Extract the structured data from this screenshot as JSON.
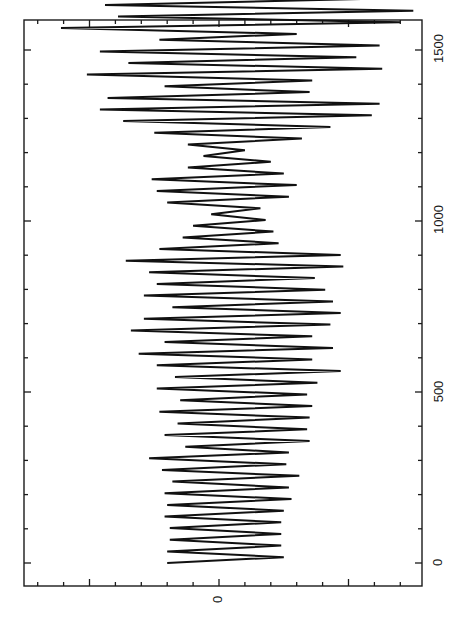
{
  "chart_data": {
    "type": "line",
    "orientation": "rotated-90-ccw",
    "title": "",
    "xlabel": "",
    "ylabel": "",
    "x_axis": {
      "range": [
        -70,
        1570
      ],
      "major_ticks": [
        0,
        500,
        1000,
        1500
      ],
      "tick_labels": [
        "0",
        "500",
        "1000",
        "1500"
      ],
      "minor_step": 100
    },
    "y_axis": {
      "range": [
        -7.6,
        7.8
      ],
      "major_ticks": [
        -5,
        0,
        5
      ],
      "tick_labels": [
        "",
        "0",
        ""
      ],
      "minor_step": 1
    },
    "grid": false,
    "legend": null,
    "series": [
      {
        "name": "signal",
        "color": "#111111",
        "x_start": 0,
        "x_step": 17,
        "peaks": [
          -2.0,
          2.5,
          -2.0,
          2.4,
          -1.9,
          2.4,
          -1.9,
          2.4,
          -2.1,
          2.5,
          -2.0,
          2.8,
          -2.1,
          2.7,
          -1.8,
          3.1,
          -2.2,
          2.6,
          -2.7,
          2.7,
          -1.3,
          3.5,
          -2.1,
          3.4,
          -1.6,
          3.5,
          -2.3,
          3.6,
          -1.5,
          3.4,
          -2.4,
          3.8,
          -1.7,
          4.7,
          -2.4,
          3.6,
          -3.1,
          4.4,
          -2.1,
          3.6,
          -3.4,
          4.3,
          -2.9,
          4.7,
          -1.8,
          4.4,
          -2.9,
          4.1,
          -2.4,
          3.7,
          -2.7,
          4.8,
          -3.6,
          4.7,
          -2.3,
          2.3,
          -1.4,
          2.1,
          -1.0,
          1.8,
          -0.3,
          1.6,
          -2.0,
          2.7,
          -2.4,
          3.0,
          -2.6,
          2.5,
          -1.2,
          2.0,
          -0.6,
          1.0,
          -1.2,
          3.2,
          -2.5,
          4.3,
          -3.7,
          5.9,
          -4.6,
          6.2,
          -4.3,
          3.5,
          -2.1,
          3.6,
          -5.1,
          6.3,
          -3.5,
          5.3,
          -4.6,
          6.2,
          -2.3,
          3.0,
          -6.1,
          7.0,
          -3.9,
          7.5,
          -4.4,
          5.5,
          -5.8,
          6.7,
          -6.5,
          6.6,
          -1.2,
          5.7,
          -5.2,
          6.3,
          -6.2,
          7.3,
          -2.2,
          6.1,
          -4.6,
          5.7,
          -3.0,
          5.5,
          -3.3,
          5.8,
          -4.5,
          4.6,
          -3.1,
          3.5,
          -4.3,
          4.7,
          -2.6,
          4.0,
          -3.1,
          2.5,
          -3.9,
          3.8,
          -2.6,
          3.5,
          -2.5,
          3.7,
          -1.5,
          2.6,
          -3.6,
          3.6,
          -2.0,
          2.5,
          -2.3,
          2.5,
          -2.6,
          2.1,
          -1.9,
          2.8,
          -2.1,
          2.0,
          -1.7,
          2.5
        ]
      }
    ]
  },
  "axes": {
    "bottom_zero_label": "0",
    "right_labels": [
      "0",
      "500",
      "1000",
      "1500"
    ]
  }
}
